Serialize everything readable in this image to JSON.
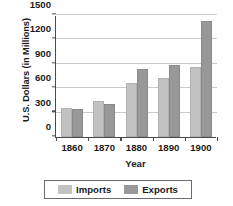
{
  "chart_data": {
    "type": "bar",
    "title": "",
    "xlabel": "Year",
    "ylabel": "U.S. Dollars (in Millions)",
    "categories": [
      "1860",
      "1870",
      "1880",
      "1890",
      "1900"
    ],
    "series": [
      {
        "name": "Imports",
        "color": "#c2c2c2",
        "values": [
          355,
          440,
          665,
          730,
          865
        ]
      },
      {
        "name": "Exports",
        "color": "#989898",
        "values": [
          340,
          405,
          835,
          880,
          1430
        ]
      }
    ],
    "ylim": [
      0,
      1500
    ],
    "yticks": [
      0,
      300,
      600,
      900,
      1200,
      1500
    ],
    "ytick_labels": [
      "0",
      "300",
      "600",
      "900",
      "1200",
      "1500"
    ],
    "grid": true,
    "legend_position": "bottom"
  },
  "legend": {
    "entries": [
      {
        "label": "Imports"
      },
      {
        "label": "Exports"
      }
    ]
  }
}
